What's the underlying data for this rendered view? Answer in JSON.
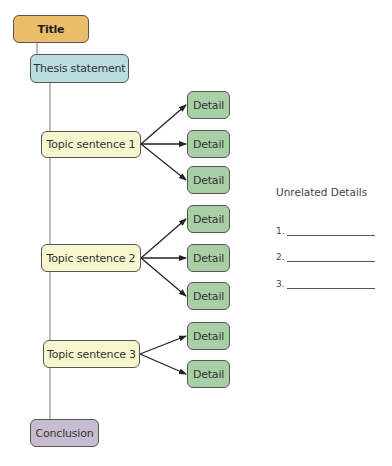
{
  "diagram": {
    "title": "Title",
    "thesis": "Thesis statement",
    "topics": [
      {
        "label": "Topic sentence 1",
        "details": [
          "Detail",
          "Detail",
          "Detail"
        ]
      },
      {
        "label": "Topic sentence 2",
        "details": [
          "Detail",
          "Detail",
          "Detail"
        ]
      },
      {
        "label": "Topic sentence 3",
        "details": [
          "Detail",
          "Detail"
        ]
      }
    ],
    "conclusion": "Conclusion"
  },
  "unrelated": {
    "heading": "Unrelated Details",
    "items": [
      "1.",
      "2.",
      "3."
    ]
  },
  "colors": {
    "title": "#e9bd6a",
    "thesis": "#b9dde0",
    "topic": "#f8f6cf",
    "detail": "#a9cfa6",
    "conclusion": "#c8bdd0"
  }
}
